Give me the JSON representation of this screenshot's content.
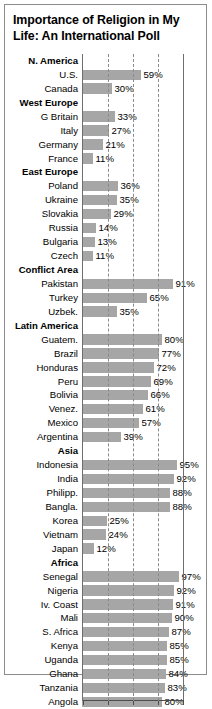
{
  "title": "Importance of Religion in My\nLife: An International Poll",
  "colors": {
    "bar": "#a6a6a6",
    "axis": "#6e6e6e",
    "grid": "#8a8a8a",
    "text": "#000000",
    "frame": "#8c8c8c",
    "background": "#ffffff"
  },
  "chart_data": {
    "type": "bar",
    "orientation": "horizontal",
    "title": "Importance of Religion in My Life: An International Poll",
    "xlabel": "",
    "ylabel": "",
    "xlim": [
      0,
      100
    ],
    "xticks": [
      0,
      25,
      50,
      75,
      100
    ],
    "grid": true,
    "gridlines_at": [
      25,
      50,
      75
    ],
    "legend": "none",
    "value_suffix": "%",
    "categories": [
      "N. America",
      "U.S.",
      "Canada",
      "West Europe",
      "G Britain",
      "Italy",
      "Germany",
      "France",
      "East Europe",
      "Poland",
      "Ukraine",
      "Slovakia",
      "Russia",
      "Bulgaria",
      "Czech",
      "Conflict Area",
      "Pakistan",
      "Turkey",
      "Uzbek.",
      "Latin America",
      "Guatem.",
      "Brazil",
      "Honduras",
      "Peru",
      "Bolivia",
      "Venez.",
      "Mexico",
      "Argentina",
      "Asia",
      "Indonesia",
      "India",
      "Philipp.",
      "Bangla.",
      "Korea",
      "Vietnam",
      "Japan",
      "Africa",
      "Senegal",
      "Nigeria",
      "Iv. Coast",
      "Mali",
      "S. Africa",
      "Kenya",
      "Uganda",
      "Ghana",
      "Tanzania",
      "Angola"
    ],
    "values": [
      null,
      59,
      30,
      null,
      33,
      27,
      21,
      11,
      null,
      36,
      35,
      29,
      14,
      13,
      11,
      null,
      91,
      65,
      35,
      null,
      80,
      77,
      72,
      69,
      66,
      61,
      57,
      39,
      null,
      95,
      92,
      88,
      88,
      25,
      24,
      12,
      null,
      97,
      92,
      91,
      90,
      87,
      85,
      85,
      84,
      83,
      80
    ],
    "groups": [
      "N. America",
      "West Europe",
      "East Europe",
      "Conflict Area",
      "Latin America",
      "Asia",
      "Africa"
    ]
  },
  "rows": [
    {
      "label": "N. America",
      "group": true,
      "value": null,
      "value_text": ""
    },
    {
      "label": "U.S.",
      "group": false,
      "value": 59,
      "value_text": "59%"
    },
    {
      "label": "Canada",
      "group": false,
      "value": 30,
      "value_text": "30%"
    },
    {
      "label": "West Europe",
      "group": true,
      "value": null,
      "value_text": ""
    },
    {
      "label": "G Britain",
      "group": false,
      "value": 33,
      "value_text": "33%"
    },
    {
      "label": "Italy",
      "group": false,
      "value": 27,
      "value_text": "27%"
    },
    {
      "label": "Germany",
      "group": false,
      "value": 21,
      "value_text": "21%"
    },
    {
      "label": "France",
      "group": false,
      "value": 11,
      "value_text": "11%"
    },
    {
      "label": "East Europe",
      "group": true,
      "value": null,
      "value_text": ""
    },
    {
      "label": "Poland",
      "group": false,
      "value": 36,
      "value_text": "36%"
    },
    {
      "label": "Ukraine",
      "group": false,
      "value": 35,
      "value_text": "35%"
    },
    {
      "label": "Slovakia",
      "group": false,
      "value": 29,
      "value_text": "29%"
    },
    {
      "label": "Russia",
      "group": false,
      "value": 14,
      "value_text": "14%"
    },
    {
      "label": "Bulgaria",
      "group": false,
      "value": 13,
      "value_text": "13%"
    },
    {
      "label": "Czech",
      "group": false,
      "value": 11,
      "value_text": "11%"
    },
    {
      "label": "Conflict Area",
      "group": true,
      "value": null,
      "value_text": ""
    },
    {
      "label": "Pakistan",
      "group": false,
      "value": 91,
      "value_text": "91%"
    },
    {
      "label": "Turkey",
      "group": false,
      "value": 65,
      "value_text": "65%"
    },
    {
      "label": "Uzbek.",
      "group": false,
      "value": 35,
      "value_text": "35%"
    },
    {
      "label": "Latin America",
      "group": true,
      "value": null,
      "value_text": ""
    },
    {
      "label": "Guatem.",
      "group": false,
      "value": 80,
      "value_text": "80%"
    },
    {
      "label": "Brazil",
      "group": false,
      "value": 77,
      "value_text": "77%"
    },
    {
      "label": "Honduras",
      "group": false,
      "value": 72,
      "value_text": "72%"
    },
    {
      "label": "Peru",
      "group": false,
      "value": 69,
      "value_text": "69%"
    },
    {
      "label": "Bolivia",
      "group": false,
      "value": 66,
      "value_text": "66%"
    },
    {
      "label": "Venez.",
      "group": false,
      "value": 61,
      "value_text": "61%"
    },
    {
      "label": "Mexico",
      "group": false,
      "value": 57,
      "value_text": "57%"
    },
    {
      "label": "Argentina",
      "group": false,
      "value": 39,
      "value_text": "39%"
    },
    {
      "label": "Asia",
      "group": true,
      "value": null,
      "value_text": ""
    },
    {
      "label": "Indonesia",
      "group": false,
      "value": 95,
      "value_text": "95%"
    },
    {
      "label": "India",
      "group": false,
      "value": 92,
      "value_text": "92%"
    },
    {
      "label": "Philipp.",
      "group": false,
      "value": 88,
      "value_text": "88%"
    },
    {
      "label": "Bangla.",
      "group": false,
      "value": 88,
      "value_text": "88%"
    },
    {
      "label": "Korea",
      "group": false,
      "value": 25,
      "value_text": "25%"
    },
    {
      "label": "Vietnam",
      "group": false,
      "value": 24,
      "value_text": "24%"
    },
    {
      "label": "Japan",
      "group": false,
      "value": 12,
      "value_text": "12%"
    },
    {
      "label": "Africa",
      "group": true,
      "value": null,
      "value_text": ""
    },
    {
      "label": "Senegal",
      "group": false,
      "value": 97,
      "value_text": "97%"
    },
    {
      "label": "Nigeria",
      "group": false,
      "value": 92,
      "value_text": "92%"
    },
    {
      "label": "Iv. Coast",
      "group": false,
      "value": 91,
      "value_text": "91%"
    },
    {
      "label": "Mali",
      "group": false,
      "value": 90,
      "value_text": "90%"
    },
    {
      "label": "S. Africa",
      "group": false,
      "value": 87,
      "value_text": "87%"
    },
    {
      "label": "Kenya",
      "group": false,
      "value": 85,
      "value_text": "85%"
    },
    {
      "label": "Uganda",
      "group": false,
      "value": 85,
      "value_text": "85%"
    },
    {
      "label": "Ghana",
      "group": false,
      "value": 84,
      "value_text": "84%"
    },
    {
      "label": "Tanzania",
      "group": false,
      "value": 83,
      "value_text": "83%"
    },
    {
      "label": "Angola",
      "group": false,
      "value": 80,
      "value_text": "80%"
    }
  ]
}
